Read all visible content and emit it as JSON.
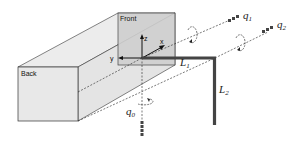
{
  "diagram": {
    "faces": {
      "front_label": "Front",
      "back_label": "Back"
    },
    "axes": {
      "x_label": "x",
      "y_label": "y",
      "z_label": "z"
    },
    "links": {
      "L1": {
        "symbol": "L",
        "subscript": "1"
      },
      "L2": {
        "symbol": "L",
        "subscript": "2"
      }
    },
    "joints": {
      "q0": {
        "symbol": "q",
        "subscript": "0"
      },
      "q1": {
        "symbol": "q",
        "subscript": "1"
      },
      "q2": {
        "symbol": "q",
        "subscript": "2"
      }
    },
    "colors": {
      "box_fill": "#e6e6e6",
      "front_fill": "#cfcfcf",
      "link_color": "#444444",
      "line_color": "#222222"
    }
  }
}
